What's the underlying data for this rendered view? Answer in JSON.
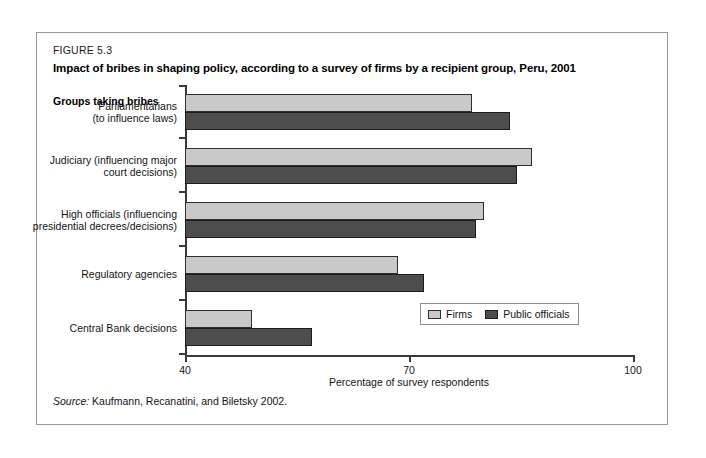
{
  "figure": {
    "number": "FIGURE 5.3",
    "title": "Impact of bribes in shaping policy, according to a survey of firms by a recipient group, Peru, 2001",
    "source_label": "Source:",
    "source_text": "Kaufmann, Recanatini, and Biletsky 2002."
  },
  "chart_data": {
    "type": "bar",
    "orientation": "horizontal",
    "title": "Impact of bribes in shaping policy, according to a survey of firms by a recipient group, Peru, 2001",
    "subtitle": "FIGURE 5.3",
    "xlabel": "Percentage of survey respondents",
    "ylabel": "Groups taking bribes",
    "xlim": [
      40,
      100
    ],
    "xticks": [
      40,
      70,
      100
    ],
    "xtick_labels": [
      "40",
      "70",
      "100"
    ],
    "grid": false,
    "legend_position": "bottom-right",
    "categories": [
      "Parliamentarians (to influence laws)",
      "Judiciary (influencing major court decisions)",
      "High officials (influencing presidential decrees/decisions)",
      "Regulatory agencies",
      "Central Bank decisions"
    ],
    "category_lines": [
      [
        "Parliamentarians",
        "(to influence laws)"
      ],
      [
        "Judiciary (influencing major",
        "court decisions)"
      ],
      [
        "High officials (influencing",
        "presidential decrees/decisions)"
      ],
      [
        "Regulatory agencies"
      ],
      [
        "Central Bank decisions"
      ]
    ],
    "series": [
      {
        "name": "Firms",
        "color": "#c9c9c9",
        "values": [
          78.5,
          86.5,
          80.0,
          68.5,
          49.0
        ]
      },
      {
        "name": "Public officials",
        "color": "#4d4d4d",
        "values": [
          83.5,
          84.5,
          79.0,
          72.0,
          57.0
        ]
      }
    ]
  }
}
